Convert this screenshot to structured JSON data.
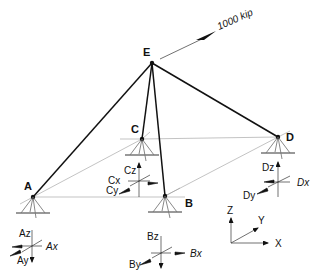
{
  "diagram": {
    "type": "3D space truss with pin supports",
    "load": {
      "label": "1000 kip",
      "applied_at": "E"
    },
    "nodes": [
      {
        "id": "E",
        "label": "E",
        "x": 152,
        "y": 63
      },
      {
        "id": "A",
        "label": "A",
        "x": 33,
        "y": 197
      },
      {
        "id": "B",
        "label": "B",
        "x": 165,
        "y": 196
      },
      {
        "id": "C",
        "label": "C",
        "x": 142,
        "y": 139
      },
      {
        "id": "D",
        "label": "D",
        "x": 278,
        "y": 137
      }
    ],
    "members": [
      {
        "from": "E",
        "to": "A"
      },
      {
        "from": "E",
        "to": "B"
      },
      {
        "from": "E",
        "to": "C"
      },
      {
        "from": "E",
        "to": "D"
      }
    ],
    "reactions": {
      "A": {
        "z": "Az",
        "x": "Ax",
        "y": "Ay"
      },
      "B": {
        "z": "Bz",
        "x": "Bx",
        "y": "By"
      },
      "C": {
        "z": "Cz",
        "x": "Cx",
        "y": "Cy"
      },
      "D": {
        "z": "Dz",
        "x": "Dx",
        "y": "Dy"
      }
    },
    "axes": {
      "x": "X",
      "y": "Y",
      "z": "Z"
    },
    "colors": {
      "member": "#111111",
      "guide": "#9a9a9a",
      "ground": "#777777"
    }
  }
}
